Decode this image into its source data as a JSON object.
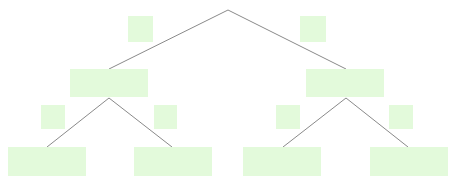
{
  "diagram": {
    "type": "binary-tree",
    "colors": {
      "node_fill": "#e3fadb",
      "edge_stroke": "#8a8a8a",
      "background": "#ffffff"
    },
    "root_point": {
      "x": 228,
      "y": 10
    },
    "nodes": [
      {
        "id": "n-left",
        "label": "",
        "x": 70,
        "y": 69,
        "w": 78,
        "h": 28
      },
      {
        "id": "n-right",
        "label": "",
        "x": 306,
        "y": 69,
        "w": 78,
        "h": 28
      },
      {
        "id": "n-left-left",
        "label": "",
        "x": 8,
        "y": 147,
        "w": 78,
        "h": 29
      },
      {
        "id": "n-left-right",
        "label": "",
        "x": 134,
        "y": 147,
        "w": 78,
        "h": 29
      },
      {
        "id": "n-right-left",
        "label": "",
        "x": 243,
        "y": 147,
        "w": 78,
        "h": 29
      },
      {
        "id": "n-right-right",
        "label": "",
        "x": 370,
        "y": 147,
        "w": 78,
        "h": 29
      }
    ],
    "edge_labels": [
      {
        "id": "el-root-left",
        "label": "",
        "x": 128,
        "y": 16,
        "w": 25,
        "h": 26
      },
      {
        "id": "el-root-right",
        "label": "",
        "x": 300,
        "y": 16,
        "w": 26,
        "h": 26
      },
      {
        "id": "el-left-left",
        "label": "",
        "x": 41,
        "y": 105,
        "w": 24,
        "h": 24
      },
      {
        "id": "el-left-right",
        "label": "",
        "x": 154,
        "y": 105,
        "w": 23,
        "h": 24
      },
      {
        "id": "el-right-left",
        "label": "",
        "x": 276,
        "y": 105,
        "w": 24,
        "h": 24
      },
      {
        "id": "el-right-right",
        "label": "",
        "x": 389,
        "y": 105,
        "w": 24,
        "h": 24
      }
    ],
    "edges": [
      {
        "from": [
          228,
          10
        ],
        "to": [
          109,
          69
        ]
      },
      {
        "from": [
          228,
          10
        ],
        "to": [
          346,
          69
        ]
      },
      {
        "from": [
          109,
          98
        ],
        "to": [
          47,
          147
        ]
      },
      {
        "from": [
          109,
          98
        ],
        "to": [
          172,
          147
        ]
      },
      {
        "from": [
          346,
          98
        ],
        "to": [
          283,
          147
        ]
      },
      {
        "from": [
          346,
          98
        ],
        "to": [
          408,
          147
        ]
      }
    ]
  }
}
